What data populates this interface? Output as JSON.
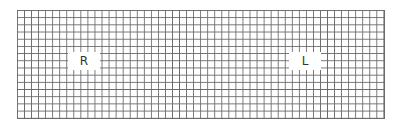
{
  "diagram": {
    "type": "grid",
    "grid": {
      "columns": 52,
      "rows": 15,
      "line_color": "#6a6a6a",
      "background": "#ffffff"
    },
    "labels": [
      {
        "text": "R",
        "position": "left"
      },
      {
        "text": "L",
        "position": "right"
      }
    ]
  }
}
